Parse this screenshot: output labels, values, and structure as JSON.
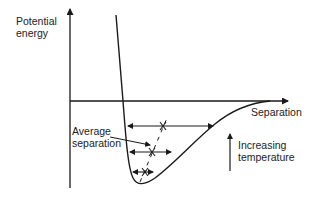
{
  "diagram": {
    "type": "potential-energy-curve",
    "y_axis_label": [
      "Potential",
      "energy"
    ],
    "x_axis_label": "Separation",
    "annotation_average": [
      "Average",
      "separation"
    ],
    "annotation_temperature": [
      "Increasing",
      "temperature"
    ],
    "line_color": "#1a1a1a",
    "vibration_levels": [
      {
        "y": 126,
        "x_left": 127,
        "x_right": 214,
        "mean_x": 163
      },
      {
        "y": 152,
        "x_left": 129,
        "x_right": 172,
        "mean_x": 152
      },
      {
        "y": 172,
        "x_left": 132,
        "x_right": 154,
        "mean_x": 145
      }
    ]
  }
}
